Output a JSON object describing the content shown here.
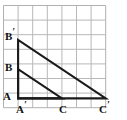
{
  "figure": {
    "kind": "geometry-diagram",
    "background_color": "#ffffff",
    "grid": {
      "columns": 7,
      "rows": 7,
      "cell_width": 14.6,
      "cell_height": 14.6,
      "origin_x": 3.5,
      "origin_y": 5.5,
      "line_color": "#b8b8b8",
      "line_width": 1,
      "border_color": "#b0b0b0"
    },
    "stroke_color": "#1a1a1a",
    "stroke_width": 2.1,
    "labels": [
      {
        "id": "B-prime",
        "base": "B",
        "prime": "′",
        "x": 5,
        "y": 31,
        "has_prime": true
      },
      {
        "id": "B",
        "base": "B",
        "prime": "",
        "x": 5,
        "y": 62,
        "has_prime": false
      },
      {
        "id": "A",
        "base": "A",
        "prime": "",
        "x": 3,
        "y": 91,
        "has_prime": false
      },
      {
        "id": "A-prime",
        "base": "A",
        "prime": "′",
        "x": 16,
        "y": 104,
        "has_prime": true
      },
      {
        "id": "C",
        "base": "C",
        "prime": "",
        "x": 59,
        "y": 104,
        "has_prime": false
      },
      {
        "id": "C-prime",
        "base": "C",
        "prime": "′",
        "x": 99,
        "y": 104,
        "has_prime": true
      }
    ],
    "points": {
      "A": {
        "x": 18.1,
        "y": 98.4
      },
      "A_prime": {
        "x": 18.1,
        "y": 98.4
      },
      "B": {
        "x": 18.1,
        "y": 69.2
      },
      "B_prime": {
        "x": 18.1,
        "y": 40.0
      },
      "C": {
        "x": 62.0,
        "y": 98.4
      },
      "C_prime": {
        "x": 105.8,
        "y": 98.4
      }
    },
    "triangles": [
      {
        "id": "small-triangle",
        "name": "triangle-ABC",
        "vertices": [
          "A",
          "B",
          "C"
        ],
        "path": "M 18.1 69.2 L 18.1 98.4 L 62.0 98.4 Z"
      },
      {
        "id": "large-triangle",
        "name": "triangle-A-prime-B-prime-C-prime",
        "vertices": [
          "A_prime",
          "B_prime",
          "C_prime"
        ],
        "path": "M 18.1 40.0 L 18.1 98.4 L 105.8 98.4 Z"
      }
    ],
    "segments": [
      {
        "id": "seg-B-prime-A-prime",
        "name": "vertical-leg",
        "x1": 18.1,
        "y1": 40.0,
        "x2": 18.1,
        "y2": 98.4
      },
      {
        "id": "seg-A-prime-C-prime",
        "name": "horizontal-leg",
        "x1": 18.1,
        "y1": 98.4,
        "x2": 105.8,
        "y2": 98.4
      },
      {
        "id": "seg-B-prime-C-prime",
        "name": "large-hypotenuse",
        "x1": 18.1,
        "y1": 40.0,
        "x2": 105.8,
        "y2": 98.4
      },
      {
        "id": "seg-B-C",
        "name": "small-hypotenuse",
        "x1": 18.1,
        "y1": 69.2,
        "x2": 62.0,
        "y2": 98.4
      }
    ]
  }
}
